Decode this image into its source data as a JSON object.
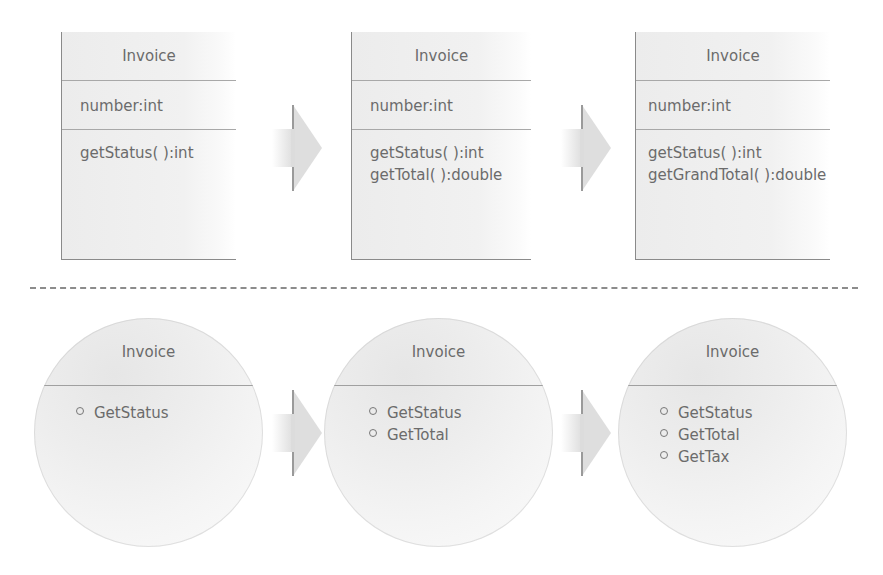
{
  "diagram": {
    "top_row": {
      "description": "UML class evolution",
      "boxes": [
        {
          "class_name": "Invoice",
          "attributes": [
            "number:int"
          ],
          "methods": [
            "getStatus( ):int"
          ]
        },
        {
          "class_name": "Invoice",
          "attributes": [
            "number:int"
          ],
          "methods": [
            "getStatus( ):int",
            "getTotal( ):double"
          ]
        },
        {
          "class_name": "Invoice",
          "attributes": [
            "number:int"
          ],
          "methods": [
            "getStatus( ):int",
            "getGrandTotal( ):double"
          ]
        }
      ],
      "arrows": 2
    },
    "separator": {
      "style": "dashed",
      "color": "#8c8c8c"
    },
    "bottom_row": {
      "description": "Interface (lollipop) evolution",
      "circles": [
        {
          "class_name": "Invoice",
          "interfaces": [
            "GetStatus"
          ]
        },
        {
          "class_name": "Invoice",
          "interfaces": [
            "GetStatus",
            "GetTotal"
          ]
        },
        {
          "class_name": "Invoice",
          "interfaces": [
            "GetStatus",
            "GetTotal",
            "GetTax"
          ]
        }
      ],
      "arrows": 2
    },
    "colors": {
      "text": "#6b6b6b",
      "border": "#8a8a8a",
      "fill": "#ececec",
      "arrow": "#dcdcdc"
    }
  }
}
